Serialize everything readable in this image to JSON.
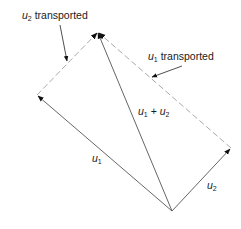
{
  "diagram": {
    "colors": {
      "solid_line": "#555555",
      "dashed_line": "#aaaaaa",
      "text": "#1a1a1a",
      "arrowhead": "#111111"
    },
    "points": {
      "origin": [
        172,
        211
      ],
      "u1_tip": [
        37,
        95
      ],
      "u2_tip": [
        231,
        148
      ],
      "sum_tip": [
        98,
        32
      ]
    },
    "labels": {
      "u1": {
        "var": "u",
        "sub": "1",
        "text": ""
      },
      "u2": {
        "var": "u",
        "sub": "2",
        "text": ""
      },
      "sum": {
        "var1": "u",
        "sub1": "1",
        "op": " + ",
        "var2": "u",
        "sub2": "2"
      },
      "u2_transported": {
        "var": "u",
        "sub": "2",
        "text": " transported"
      },
      "u1_transported": {
        "var": "u",
        "sub": "1",
        "text": " transported"
      }
    }
  }
}
